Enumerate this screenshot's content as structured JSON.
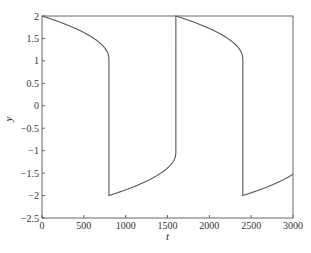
{
  "chart_data": {
    "type": "line",
    "title": "",
    "xlabel": "t",
    "ylabel": "y",
    "xlim": [
      0,
      3000
    ],
    "ylim": [
      -2.5,
      2
    ],
    "xticks": [
      0,
      500,
      1000,
      1500,
      2000,
      2500,
      3000
    ],
    "xtick_labels": [
      "0",
      "500",
      "1000",
      "1500",
      "2000",
      "2500",
      "3000"
    ],
    "yticks": [
      2,
      1.5,
      1,
      0.5,
      0,
      -0.5,
      -1,
      -1.5,
      -2,
      -2.5
    ],
    "ytick_labels": [
      "2",
      "1.5",
      "1",
      "0.5",
      "0",
      "−0.5",
      "−1",
      "−1.5",
      "−2",
      "−2.5"
    ],
    "grid": false,
    "legend": null,
    "series": [
      {
        "name": "y(t)",
        "color": "#555555",
        "description": "Relaxation oscillation (van der Pol type, large mu). Starts at y=2, decays slowly to y~1 at t~800, jumps to y~-2, rises slowly to y~-1 at t~1600, jumps to y=2, repeats; period ~1600.",
        "x": [
          0,
          100,
          200,
          300,
          400,
          500,
          600,
          700,
          760,
          800,
          800,
          900,
          1000,
          1100,
          1200,
          1300,
          1400,
          1500,
          1560,
          1600,
          1600,
          1700,
          1800,
          1900,
          2000,
          2100,
          2200,
          2300,
          2360,
          2400,
          2400,
          2500,
          2600,
          2700,
          2800,
          2900,
          3000
        ],
        "values": [
          2.0,
          1.93,
          1.85,
          1.77,
          1.68,
          1.58,
          1.47,
          1.33,
          1.2,
          1.05,
          -2.0,
          -1.93,
          -1.85,
          -1.77,
          -1.68,
          -1.58,
          -1.47,
          -1.33,
          -1.2,
          -1.05,
          2.0,
          1.93,
          1.85,
          1.77,
          1.68,
          1.58,
          1.47,
          1.33,
          1.2,
          1.05,
          -2.0,
          -1.93,
          -1.85,
          -1.77,
          -1.68,
          -1.58,
          -1.47
        ]
      }
    ]
  }
}
